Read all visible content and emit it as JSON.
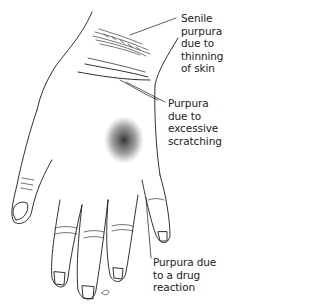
{
  "figure": {
    "line_color": "#1a1a1a",
    "background": "#ffffff"
  },
  "annotations": [
    {
      "id": "senile",
      "text": "Senile\npurpura\ndue to\nthinning\nof skin"
    },
    {
      "id": "scratch",
      "text": "Purpura\ndue to\nexcessive\nscratching"
    },
    {
      "id": "drug",
      "text": "Purpura due\nto a drug\nreaction"
    }
  ]
}
